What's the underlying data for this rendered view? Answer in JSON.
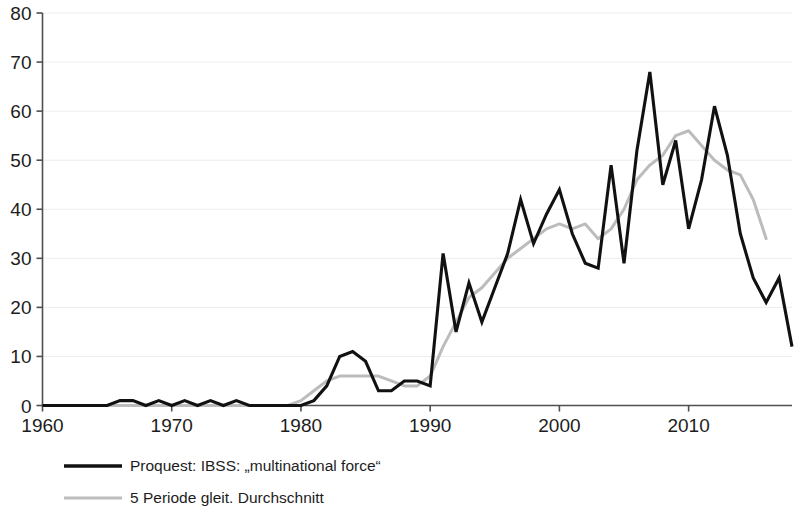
{
  "chart_data": {
    "type": "line",
    "title": "",
    "xlabel": "",
    "ylabel": "",
    "xlim": [
      1960,
      2018
    ],
    "ylim": [
      0,
      80
    ],
    "grid": true,
    "legend_position": "bottom-left",
    "y_ticks": [
      0,
      10,
      20,
      30,
      40,
      50,
      60,
      70,
      80
    ],
    "x_ticks": [
      1960,
      1970,
      1980,
      1990,
      2000,
      2010
    ],
    "x": [
      1960,
      1961,
      1962,
      1963,
      1964,
      1965,
      1966,
      1967,
      1968,
      1969,
      1970,
      1971,
      1972,
      1973,
      1974,
      1975,
      1976,
      1977,
      1978,
      1979,
      1980,
      1981,
      1982,
      1983,
      1984,
      1985,
      1986,
      1987,
      1988,
      1989,
      1990,
      1991,
      1992,
      1993,
      1994,
      1995,
      1996,
      1997,
      1998,
      1999,
      2000,
      2001,
      2002,
      2003,
      2004,
      2005,
      2006,
      2007,
      2008,
      2009,
      2010,
      2011,
      2012,
      2013,
      2014,
      2015,
      2016,
      2017,
      2018
    ],
    "series": [
      {
        "name": "Proquest: IBSS: „multinational force“",
        "color": "#111111",
        "values": [
          0,
          0,
          0,
          0,
          0,
          0,
          1,
          1,
          0,
          1,
          0,
          1,
          0,
          1,
          0,
          1,
          0,
          0,
          0,
          0,
          0,
          1,
          4,
          10,
          11,
          9,
          3,
          3,
          5,
          5,
          4,
          31,
          15,
          25,
          17,
          24,
          31,
          42,
          33,
          39,
          44,
          35,
          29,
          28,
          49,
          29,
          52,
          68,
          45,
          54,
          36,
          46,
          61,
          51,
          35,
          26,
          21,
          26,
          12
        ]
      },
      {
        "name": "5 Periode gleit. Durchschnitt",
        "color": "#bcbcbc",
        "values": [
          null,
          null,
          0,
          0,
          0,
          0,
          0,
          0,
          0,
          0,
          0,
          0,
          0,
          0,
          0,
          0,
          0,
          0,
          0,
          0,
          1,
          3,
          5,
          6,
          6,
          6,
          6,
          5,
          4,
          4,
          6,
          12,
          17,
          22,
          24,
          27,
          30,
          32,
          34,
          36,
          37,
          36,
          37,
          34,
          36,
          40,
          46,
          49,
          51,
          55,
          56,
          53,
          50,
          48,
          47,
          42,
          34,
          null,
          null
        ]
      }
    ]
  },
  "axis": {
    "y_labels": [
      "80",
      "70",
      "60",
      "50",
      "40",
      "30",
      "20",
      "10",
      "0"
    ],
    "x_labels": [
      "1960",
      "1970",
      "1980",
      "1990",
      "2000",
      "2010"
    ]
  },
  "legend": {
    "items": [
      {
        "label": "Proquest: IBSS: „multinational force“",
        "color": "#111111"
      },
      {
        "label": "5 Periode gleit. Durchschnitt",
        "color": "#bcbcbc"
      }
    ]
  }
}
